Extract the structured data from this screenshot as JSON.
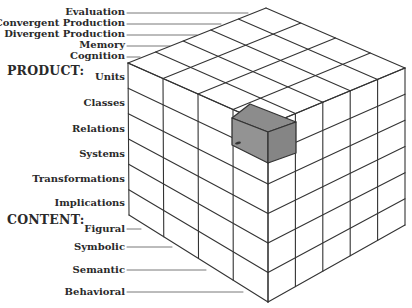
{
  "diagram": {
    "colors": {
      "line": "#333333",
      "shade_top": "#8c8c8c",
      "shade_left": "#939393",
      "shade_right": "#858585",
      "background": "#ffffff"
    },
    "operation": {
      "items": [
        "Evaluation",
        "Convergent Production",
        "Divergent Production",
        "Memory",
        "Cognition"
      ]
    },
    "product": {
      "heading": "PRODUCT:",
      "items": [
        "Units",
        "Classes",
        "Relations",
        "Systems",
        "Transformations",
        "Implications"
      ]
    },
    "content": {
      "heading": "CONTENT:",
      "items": [
        "Figural",
        "Symbolic",
        "Semantic",
        "Behavioral"
      ]
    },
    "grid": {
      "content_columns": 4,
      "operation_columns": 5,
      "product_rows": 6
    },
    "highlighted_cell": {
      "product": "Classes",
      "content": "Behavioral",
      "operation": "Cognition",
      "shade": "gray"
    }
  }
}
